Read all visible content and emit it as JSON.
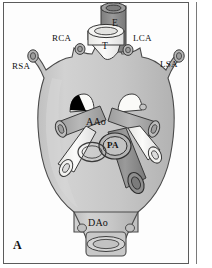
{
  "figure": {
    "panel_letter": "A",
    "type": "anatomical-illustration",
    "background_color": "#ffffff",
    "frame_color": "#5b5b5b"
  },
  "palette": {
    "vessel_body_fill": "#c9c9c9",
    "vessel_body_shade": "#b3b3b3",
    "vessel_light_fill": "#f2f2f0",
    "vessel_dark_fill": "#8c8c8c",
    "vessel_mid_fill": "#a8a8a8",
    "outline": "#3a3a3a",
    "marker_black": "#000000",
    "label_color": "#111111"
  },
  "labels": [
    {
      "id": "rsa",
      "text": "RSA",
      "meaning": "right subclavian artery",
      "x": 12,
      "y": 66,
      "size": "sm"
    },
    {
      "id": "rca",
      "text": "RCA",
      "meaning": "right carotid artery",
      "x": 52,
      "y": 38,
      "size": "sm"
    },
    {
      "id": "e",
      "text": "E",
      "meaning": "esophagus",
      "x": 114,
      "y": 22,
      "size": "tube"
    },
    {
      "id": "t",
      "text": "T",
      "meaning": "trachea",
      "x": 100,
      "y": 45,
      "size": "tube"
    },
    {
      "id": "lca",
      "text": "LCA",
      "meaning": "left carotid artery",
      "x": 131,
      "y": 38,
      "size": "sm"
    },
    {
      "id": "lsa",
      "text": "LSA",
      "meaning": "left subclavian artery",
      "x": 159,
      "y": 64,
      "size": "sm"
    },
    {
      "id": "aao",
      "text": "AAo",
      "meaning": "ascending aorta",
      "x": 88,
      "y": 121,
      "size": "md"
    },
    {
      "id": "pa",
      "text": "PA",
      "meaning": "pulmonary artery",
      "x": 111,
      "y": 142,
      "size": "sm"
    },
    {
      "id": "dao",
      "text": "DAo",
      "meaning": "descending aorta",
      "x": 88,
      "y": 222,
      "size": "md"
    }
  ],
  "structures": [
    {
      "name": "esophagus-tube",
      "shade": "dark"
    },
    {
      "name": "trachea-tube",
      "shade": "light"
    },
    {
      "name": "right-subclavian-stump",
      "shade": "mid"
    },
    {
      "name": "right-carotid-stump",
      "shade": "mid"
    },
    {
      "name": "left-carotid-stump",
      "shade": "mid"
    },
    {
      "name": "left-subclavian-stump",
      "shade": "mid"
    },
    {
      "name": "ascending-aorta-body",
      "shade": "body"
    },
    {
      "name": "pulmonary-artery-trunk",
      "shade": "mid"
    },
    {
      "name": "descending-aorta-ring",
      "shade": "body"
    },
    {
      "name": "black-wedge-marker",
      "shade": "black"
    }
  ]
}
